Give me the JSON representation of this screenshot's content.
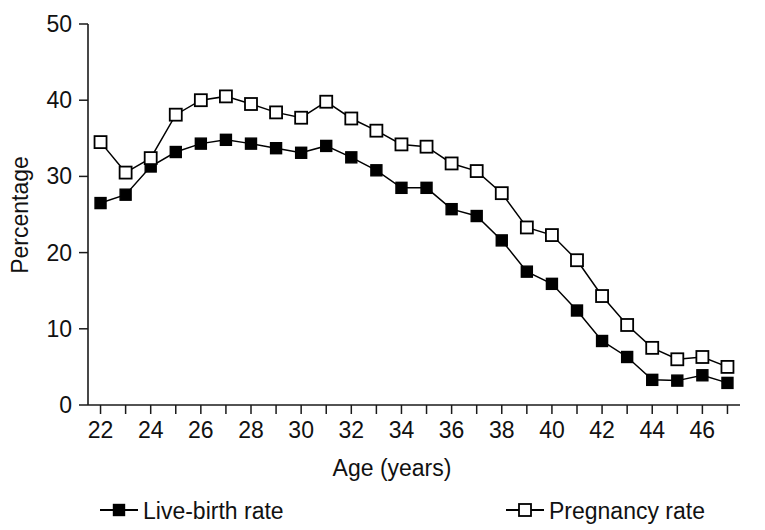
{
  "chart_data": {
    "type": "line",
    "title": "",
    "subtitle": "",
    "xlabel": "Age (years)",
    "ylabel": "Percentage",
    "xlim": [
      21.5,
      47.5
    ],
    "ylim": [
      0,
      50
    ],
    "xticks": [
      22,
      23,
      24,
      25,
      26,
      27,
      28,
      29,
      30,
      31,
      32,
      33,
      34,
      35,
      36,
      37,
      38,
      39,
      40,
      41,
      42,
      43,
      44,
      45,
      46,
      47
    ],
    "xtick_labels": [
      "22",
      "",
      "24",
      "",
      "26",
      "",
      "28",
      "",
      "30",
      "",
      "32",
      "",
      "34",
      "",
      "36",
      "",
      "38",
      "",
      "40",
      "",
      "42",
      "",
      "44",
      "",
      "46",
      ""
    ],
    "yticks": [
      0,
      10,
      20,
      30,
      40,
      50
    ],
    "ytick_labels": [
      "0",
      "10",
      "20",
      "30",
      "40",
      "50"
    ],
    "grid": false,
    "legend_position": "bottom",
    "x": [
      22,
      23,
      24,
      25,
      26,
      27,
      28,
      29,
      30,
      31,
      32,
      33,
      34,
      35,
      36,
      37,
      38,
      39,
      40,
      41,
      42,
      43,
      44,
      45,
      46,
      47
    ],
    "series": [
      {
        "name": "Live-birth rate",
        "marker": "filled-square",
        "color": "#000000",
        "values": [
          26.5,
          27.6,
          31.3,
          33.2,
          34.3,
          34.8,
          34.3,
          33.7,
          33.1,
          34.0,
          32.5,
          30.8,
          28.5,
          28.5,
          25.7,
          24.8,
          21.6,
          17.5,
          15.9,
          12.4,
          8.4,
          6.3,
          3.3,
          3.2,
          3.9,
          2.9
        ]
      },
      {
        "name": "Pregnancy rate",
        "marker": "open-square",
        "color": "#000000",
        "values": [
          34.5,
          30.5,
          32.4,
          38.1,
          40.0,
          40.5,
          39.5,
          38.4,
          37.7,
          39.8,
          37.6,
          36.0,
          34.2,
          33.9,
          31.7,
          30.7,
          27.8,
          23.3,
          22.3,
          19.0,
          14.3,
          10.5,
          7.5,
          6.0,
          6.3,
          5.0
        ]
      }
    ]
  },
  "legend": {
    "items": [
      {
        "label": "Live-birth rate",
        "marker": "filled-square"
      },
      {
        "label": "Pregnancy rate",
        "marker": "open-square"
      }
    ]
  }
}
